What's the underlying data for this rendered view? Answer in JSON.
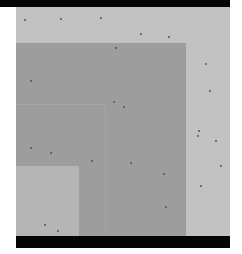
{
  "image": {
    "description": "Grayscale microscopy-style image of nested rectangular layers",
    "colors": {
      "bar": "#050505",
      "margin": "#ffffff",
      "background_layer": "#c2c2c2",
      "middle_layer": "#9d9d9d",
      "inner_line": "#b0b0b0",
      "light_inner_layer": "#b5b5b5",
      "speck": "#555555"
    },
    "specks": [
      [
        60,
        18
      ],
      [
        24,
        19
      ],
      [
        100,
        17
      ],
      [
        140,
        33
      ],
      [
        168,
        36
      ],
      [
        205,
        63
      ],
      [
        209,
        90
      ],
      [
        115,
        47
      ],
      [
        30,
        80
      ],
      [
        113,
        101
      ],
      [
        123,
        106
      ],
      [
        197,
        135
      ],
      [
        198,
        130
      ],
      [
        30,
        147
      ],
      [
        50,
        152
      ],
      [
        91,
        160
      ],
      [
        130,
        162
      ],
      [
        163,
        173
      ],
      [
        200,
        185
      ],
      [
        165,
        206
      ],
      [
        44,
        224
      ],
      [
        57,
        230
      ],
      [
        215,
        140
      ],
      [
        220,
        165
      ]
    ]
  }
}
